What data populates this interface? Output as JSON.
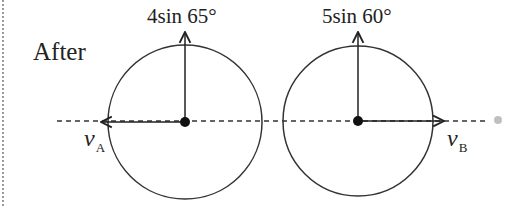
{
  "diagram": {
    "state_label": "After",
    "objects": [
      {
        "id": "A",
        "vertical_component_label": "4sin 65°",
        "horizontal_velocity_label": "v",
        "horizontal_velocity_subscript": "A",
        "horizontal_direction": "left"
      },
      {
        "id": "B",
        "vertical_component_label": "5sin 60°",
        "horizontal_velocity_label": "v",
        "horizontal_velocity_subscript": "B",
        "horizontal_direction": "right"
      }
    ],
    "colors": {
      "stroke": "#222222",
      "dot_gray": "#c0c0c0",
      "border": "#9a9a9a"
    }
  }
}
